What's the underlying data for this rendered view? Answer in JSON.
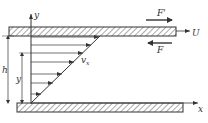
{
  "diagram": {
    "type": "couette-flow",
    "labels": {
      "y_axis": "y",
      "x_axis": "x",
      "force_top": "F'",
      "force_bottom": "F",
      "velocity": "U",
      "velocity_profile": "v",
      "velocity_profile_sub": "x",
      "gap_height": "h",
      "position": "y"
    },
    "colors": {
      "line": "#333333",
      "hatch": "#555555",
      "background": "#ffffff"
    },
    "profile_arrows": 7
  }
}
